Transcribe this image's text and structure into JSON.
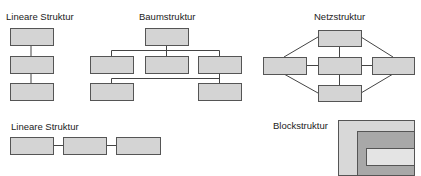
{
  "colors": {
    "box_fill": "#d4d4d4",
    "box_stroke": "#555555",
    "line": "#444444",
    "block_outer": "#d8d8d8",
    "block_middle": "#a8a8a8",
    "block_inner": "#e4e4e4"
  },
  "diagrams": {
    "linear_vertical": {
      "title": "Lineare Struktur"
    },
    "tree": {
      "title": "Baumstruktur"
    },
    "network": {
      "title": "Netzstruktur"
    },
    "linear_horizontal": {
      "title": "Lineare Struktur"
    },
    "block": {
      "title": "Blockstruktur"
    }
  }
}
